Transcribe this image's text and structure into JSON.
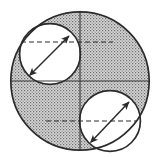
{
  "figure": {
    "title": "Shaded region between a large circle and two inscribed circles",
    "background_color": "#ffffff",
    "stroke_color": "#2b2b2b",
    "shade_color": "#9a9a9a",
    "shade_style": "stipple",
    "canvas": {
      "width": 157,
      "height": 157
    },
    "caption": "",
    "label_large": "",
    "label_small_upper": "",
    "label_small_lower": ""
  },
  "geometry": {
    "large_circle": {
      "name": "large-circle",
      "cx": 80,
      "cy": 81,
      "r": 70,
      "fill": "shaded",
      "stroke_width": 1.6
    },
    "small_circles": [
      {
        "name": "upper-left-circle",
        "cx": 50,
        "cy": 54,
        "r": 31,
        "fill": "white",
        "stroke_width": 1.6,
        "dashed_chord": {
          "x1": 21,
          "y1": 42,
          "x2": 80,
          "y2": 42
        },
        "radius_arrow": {
          "x1": 30,
          "y1": 75,
          "x2": 69,
          "y2": 36,
          "double_headed": true
        }
      },
      {
        "name": "lower-right-circle",
        "cx": 110,
        "cy": 121,
        "r": 31,
        "fill": "white",
        "stroke_width": 1.6,
        "dashed_chord": {
          "x1": 80,
          "y1": 121,
          "x2": 141,
          "y2": 121
        },
        "radius_arrow": {
          "x1": 91,
          "y1": 142,
          "x2": 129,
          "y2": 102,
          "double_headed": true
        }
      }
    ],
    "axes": {
      "horizontal_diameter": {
        "name": "horizontal-diameter",
        "x1": 10,
        "y1": 81,
        "x2": 150,
        "y2": 81
      },
      "vertical_diameter": {
        "name": "vertical-diameter",
        "x1": 80,
        "y1": 11,
        "x2": 80,
        "y2": 151
      }
    },
    "dashed_lines": [
      {
        "name": "upper-dashed-chord",
        "x1": 21,
        "y1": 42,
        "x2": 113,
        "y2": 42
      },
      {
        "name": "lower-dashed-chord",
        "x1": 46,
        "y1": 121,
        "x2": 141,
        "y2": 121
      }
    ],
    "dash_pattern": "5 3"
  }
}
